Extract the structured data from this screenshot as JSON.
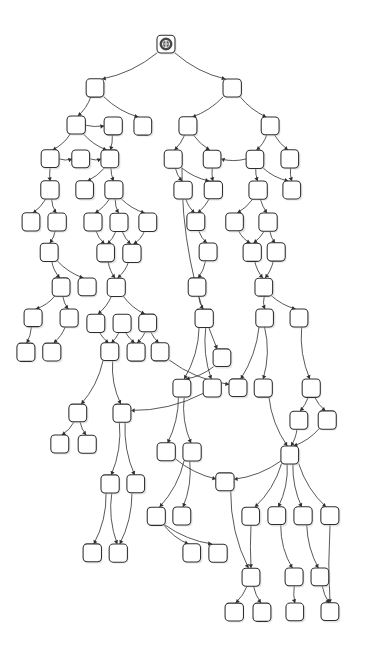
{
  "meta": {
    "watermark_text": "",
    "background_color": "#ffffff",
    "node_fill": "#ffffff",
    "node_stroke": "#2e2e2e",
    "edge_stroke": "#3a3a3a",
    "shadow_color": "#c9c9c9",
    "root_icon_color": "#4a4a4a",
    "width": 369,
    "height": 658
  },
  "graph_data": {
    "type": "tree",
    "style": "hand-drawn-sketchy",
    "node_shape": "rounded-square",
    "node_label_text": "",
    "node_count": 103,
    "edge_count": 109,
    "root_id": "n0",
    "root_icon": "globe-icon",
    "node_size": 18,
    "node_corner_radius": 4,
    "nodes": [
      {
        "id": "n0",
        "x": 166,
        "y": 44,
        "root": true
      },
      {
        "id": "n1",
        "x": 95,
        "y": 88
      },
      {
        "id": "n2",
        "x": 232,
        "y": 88
      },
      {
        "id": "n3",
        "x": 76,
        "y": 125
      },
      {
        "id": "n4",
        "x": 113,
        "y": 126
      },
      {
        "id": "n5",
        "x": 143,
        "y": 126
      },
      {
        "id": "n6",
        "x": 188,
        "y": 126
      },
      {
        "id": "n7",
        "x": 270,
        "y": 126
      },
      {
        "id": "n8",
        "x": 50,
        "y": 159
      },
      {
        "id": "n9",
        "x": 81,
        "y": 159
      },
      {
        "id": "n10",
        "x": 110,
        "y": 159
      },
      {
        "id": "n11",
        "x": 173,
        "y": 159
      },
      {
        "id": "n12",
        "x": 212,
        "y": 159
      },
      {
        "id": "n13",
        "x": 255,
        "y": 159
      },
      {
        "id": "n14",
        "x": 290,
        "y": 159
      },
      {
        "id": "n15",
        "x": 50,
        "y": 190
      },
      {
        "id": "n16",
        "x": 85,
        "y": 190
      },
      {
        "id": "n17",
        "x": 114,
        "y": 190
      },
      {
        "id": "n18",
        "x": 183,
        "y": 190
      },
      {
        "id": "n19",
        "x": 213,
        "y": 190
      },
      {
        "id": "n20",
        "x": 258,
        "y": 190
      },
      {
        "id": "n21",
        "x": 292,
        "y": 190
      },
      {
        "id": "n22",
        "x": 31,
        "y": 222
      },
      {
        "id": "n23",
        "x": 57,
        "y": 222
      },
      {
        "id": "n24",
        "x": 93,
        "y": 222
      },
      {
        "id": "n25",
        "x": 119,
        "y": 222
      },
      {
        "id": "n26",
        "x": 148,
        "y": 222
      },
      {
        "id": "n27",
        "x": 196,
        "y": 222
      },
      {
        "id": "n28",
        "x": 235,
        "y": 222
      },
      {
        "id": "n29",
        "x": 268,
        "y": 222
      },
      {
        "id": "n30",
        "x": 49,
        "y": 252
      },
      {
        "id": "n31",
        "x": 106,
        "y": 253
      },
      {
        "id": "n32",
        "x": 132,
        "y": 253
      },
      {
        "id": "n33",
        "x": 208,
        "y": 252
      },
      {
        "id": "n34",
        "x": 252,
        "y": 252
      },
      {
        "id": "n35",
        "x": 276,
        "y": 252
      },
      {
        "id": "n36",
        "x": 61,
        "y": 287
      },
      {
        "id": "n37",
        "x": 87,
        "y": 287
      },
      {
        "id": "n38",
        "x": 116,
        "y": 287
      },
      {
        "id": "n39",
        "x": 197,
        "y": 287
      },
      {
        "id": "n40",
        "x": 264,
        "y": 287
      },
      {
        "id": "n41",
        "x": 33,
        "y": 318
      },
      {
        "id": "n42",
        "x": 69,
        "y": 318
      },
      {
        "id": "n43",
        "x": 96,
        "y": 323
      },
      {
        "id": "n44",
        "x": 122,
        "y": 323
      },
      {
        "id": "n45",
        "x": 148,
        "y": 323
      },
      {
        "id": "n46",
        "x": 204,
        "y": 318
      },
      {
        "id": "n47",
        "x": 265,
        "y": 318
      },
      {
        "id": "n48",
        "x": 299,
        "y": 318
      },
      {
        "id": "n49",
        "x": 26,
        "y": 352
      },
      {
        "id": "n50",
        "x": 52,
        "y": 352
      },
      {
        "id": "n51",
        "x": 110,
        "y": 352
      },
      {
        "id": "n52",
        "x": 136,
        "y": 352
      },
      {
        "id": "n53",
        "x": 160,
        "y": 352
      },
      {
        "id": "n54",
        "x": 222,
        "y": 358
      },
      {
        "id": "n55",
        "x": 182,
        "y": 388
      },
      {
        "id": "n56",
        "x": 212,
        "y": 388
      },
      {
        "id": "n57",
        "x": 238,
        "y": 388
      },
      {
        "id": "n58",
        "x": 263,
        "y": 388
      },
      {
        "id": "n59",
        "x": 311,
        "y": 388
      },
      {
        "id": "n60",
        "x": 78,
        "y": 413
      },
      {
        "id": "n61",
        "x": 122,
        "y": 413
      },
      {
        "id": "n62",
        "x": 299,
        "y": 420
      },
      {
        "id": "n63",
        "x": 327,
        "y": 420
      },
      {
        "id": "n64",
        "x": 60,
        "y": 444
      },
      {
        "id": "n65",
        "x": 87,
        "y": 444
      },
      {
        "id": "n66",
        "x": 166,
        "y": 452
      },
      {
        "id": "n67",
        "x": 192,
        "y": 452
      },
      {
        "id": "n68",
        "x": 290,
        "y": 455
      },
      {
        "id": "n69",
        "x": 110,
        "y": 484
      },
      {
        "id": "n70",
        "x": 136,
        "y": 484
      },
      {
        "id": "n71",
        "x": 225,
        "y": 482
      },
      {
        "id": "n72",
        "x": 251,
        "y": 516
      },
      {
        "id": "n73",
        "x": 277,
        "y": 516
      },
      {
        "id": "n74",
        "x": 303,
        "y": 516
      },
      {
        "id": "n75",
        "x": 330,
        "y": 516
      },
      {
        "id": "n76",
        "x": 156,
        "y": 516
      },
      {
        "id": "n77",
        "x": 182,
        "y": 516
      },
      {
        "id": "n78",
        "x": 92,
        "y": 553
      },
      {
        "id": "n79",
        "x": 118,
        "y": 553
      },
      {
        "id": "n80",
        "x": 192,
        "y": 553
      },
      {
        "id": "n81",
        "x": 218,
        "y": 553
      },
      {
        "id": "n82",
        "x": 251,
        "y": 577
      },
      {
        "id": "n83",
        "x": 294,
        "y": 577
      },
      {
        "id": "n84",
        "x": 320,
        "y": 577
      },
      {
        "id": "n85",
        "x": 234,
        "y": 612
      },
      {
        "id": "n86",
        "x": 262,
        "y": 612
      },
      {
        "id": "n87",
        "x": 295,
        "y": 612
      },
      {
        "id": "n88",
        "x": 330,
        "y": 612
      }
    ],
    "edges": [
      {
        "from": "n0",
        "to": "n1"
      },
      {
        "from": "n0",
        "to": "n2"
      },
      {
        "from": "n1",
        "to": "n3"
      },
      {
        "from": "n1",
        "to": "n5"
      },
      {
        "from": "n2",
        "to": "n6"
      },
      {
        "from": "n2",
        "to": "n7"
      },
      {
        "from": "n3",
        "to": "n4"
      },
      {
        "from": "n3",
        "to": "n8"
      },
      {
        "from": "n3",
        "to": "n10"
      },
      {
        "from": "n4",
        "to": "n10"
      },
      {
        "from": "n6",
        "to": "n11"
      },
      {
        "from": "n6",
        "to": "n12"
      },
      {
        "from": "n7",
        "to": "n13"
      },
      {
        "from": "n7",
        "to": "n14"
      },
      {
        "from": "n8",
        "to": "n9"
      },
      {
        "from": "n8",
        "to": "n15"
      },
      {
        "from": "n9",
        "to": "n10"
      },
      {
        "from": "n10",
        "to": "n17"
      },
      {
        "from": "n10",
        "to": "n16"
      },
      {
        "from": "n11",
        "to": "n18"
      },
      {
        "from": "n11",
        "to": "n19"
      },
      {
        "from": "n13",
        "to": "n12"
      },
      {
        "from": "n13",
        "to": "n20"
      },
      {
        "from": "n13",
        "to": "n21"
      },
      {
        "from": "n14",
        "to": "n21"
      },
      {
        "from": "n15",
        "to": "n22"
      },
      {
        "from": "n15",
        "to": "n23"
      },
      {
        "from": "n17",
        "to": "n24"
      },
      {
        "from": "n17",
        "to": "n25"
      },
      {
        "from": "n17",
        "to": "n26"
      },
      {
        "from": "n18",
        "to": "n27"
      },
      {
        "from": "n20",
        "to": "n28"
      },
      {
        "from": "n20",
        "to": "n29"
      },
      {
        "from": "n23",
        "to": "n30"
      },
      {
        "from": "n24",
        "to": "n31"
      },
      {
        "from": "n25",
        "to": "n31"
      },
      {
        "from": "n25",
        "to": "n32"
      },
      {
        "from": "n26",
        "to": "n32"
      },
      {
        "from": "n27",
        "to": "n33"
      },
      {
        "from": "n28",
        "to": "n34"
      },
      {
        "from": "n29",
        "to": "n35"
      },
      {
        "from": "n29",
        "to": "n34"
      },
      {
        "from": "n30",
        "to": "n36"
      },
      {
        "from": "n30",
        "to": "n37"
      },
      {
        "from": "n31",
        "to": "n38"
      },
      {
        "from": "n32",
        "to": "n38"
      },
      {
        "from": "n33",
        "to": "n39"
      },
      {
        "from": "n34",
        "to": "n40"
      },
      {
        "from": "n36",
        "to": "n41"
      },
      {
        "from": "n36",
        "to": "n42"
      },
      {
        "from": "n38",
        "to": "n43"
      },
      {
        "from": "n38",
        "to": "n45"
      },
      {
        "from": "n39",
        "to": "n46"
      },
      {
        "from": "n40",
        "to": "n47"
      },
      {
        "from": "n40",
        "to": "n48"
      },
      {
        "from": "n41",
        "to": "n49"
      },
      {
        "from": "n42",
        "to": "n50"
      },
      {
        "from": "n43",
        "to": "n51"
      },
      {
        "from": "n44",
        "to": "n51"
      },
      {
        "from": "n45",
        "to": "n52"
      },
      {
        "from": "n45",
        "to": "n53"
      },
      {
        "from": "n11",
        "to": "n54"
      },
      {
        "from": "n46",
        "to": "n55"
      },
      {
        "from": "n46",
        "to": "n56"
      },
      {
        "from": "n47",
        "to": "n57"
      },
      {
        "from": "n47",
        "to": "n58"
      },
      {
        "from": "n48",
        "to": "n59"
      },
      {
        "from": "n51",
        "to": "n60"
      },
      {
        "from": "n51",
        "to": "n61"
      },
      {
        "from": "n54",
        "to": "n55"
      },
      {
        "from": "n59",
        "to": "n62"
      },
      {
        "from": "n59",
        "to": "n63"
      },
      {
        "from": "n60",
        "to": "n64"
      },
      {
        "from": "n60",
        "to": "n65"
      },
      {
        "from": "n55",
        "to": "n66"
      },
      {
        "from": "n55",
        "to": "n67"
      },
      {
        "from": "n58",
        "to": "n68"
      },
      {
        "from": "n62",
        "to": "n68"
      },
      {
        "from": "n61",
        "to": "n69"
      },
      {
        "from": "n61",
        "to": "n70"
      },
      {
        "from": "n66",
        "to": "n71"
      },
      {
        "from": "n68",
        "to": "n71"
      },
      {
        "from": "n68",
        "to": "n72"
      },
      {
        "from": "n68",
        "to": "n73"
      },
      {
        "from": "n68",
        "to": "n74"
      },
      {
        "from": "n68",
        "to": "n75"
      },
      {
        "from": "n67",
        "to": "n76"
      },
      {
        "from": "n67",
        "to": "n77"
      },
      {
        "from": "n69",
        "to": "n78"
      },
      {
        "from": "n69",
        "to": "n79"
      },
      {
        "from": "n76",
        "to": "n80"
      },
      {
        "from": "n76",
        "to": "n81"
      },
      {
        "from": "n71",
        "to": "n82"
      },
      {
        "from": "n72",
        "to": "n82"
      },
      {
        "from": "n73",
        "to": "n83"
      },
      {
        "from": "n74",
        "to": "n84"
      },
      {
        "from": "n82",
        "to": "n85"
      },
      {
        "from": "n82",
        "to": "n86"
      },
      {
        "from": "n83",
        "to": "n87"
      },
      {
        "from": "n84",
        "to": "n88"
      },
      {
        "from": "n12",
        "to": "n19"
      },
      {
        "from": "n19",
        "to": "n27"
      },
      {
        "from": "n35",
        "to": "n40"
      },
      {
        "from": "n44",
        "to": "n52"
      },
      {
        "from": "n53",
        "to": "n57"
      },
      {
        "from": "n56",
        "to": "n61"
      },
      {
        "from": "n63",
        "to": "n68"
      },
      {
        "from": "n70",
        "to": "n79"
      },
      {
        "from": "n75",
        "to": "n88"
      }
    ]
  }
}
